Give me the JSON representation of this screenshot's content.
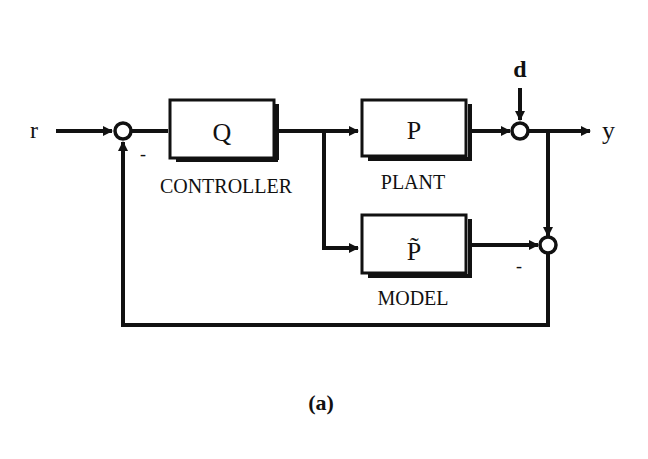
{
  "diagram": {
    "type": "block-diagram",
    "caption": "(a)",
    "signals": {
      "reference": "r",
      "disturbance": "d",
      "output": "y"
    },
    "blocks": [
      {
        "id": "Q",
        "symbol": "Q",
        "label": "CONTROLLER"
      },
      {
        "id": "P",
        "symbol": "P",
        "label": "PLANT"
      },
      {
        "id": "Ptilde",
        "symbol": "P̃",
        "label": "MODEL"
      }
    ],
    "summing_junctions": [
      {
        "id": "sum1",
        "inputs": [
          "r (+)",
          "feedback (-)"
        ],
        "minus_sign": "-"
      },
      {
        "id": "sum2",
        "inputs": [
          "P output (+)",
          "d (+)"
        ]
      },
      {
        "id": "sum3",
        "inputs": [
          "y (+)",
          "model output (-)"
        ],
        "minus_sign": "-"
      }
    ],
    "colors": {
      "ink": "#111111",
      "background": "#ffffff"
    }
  }
}
